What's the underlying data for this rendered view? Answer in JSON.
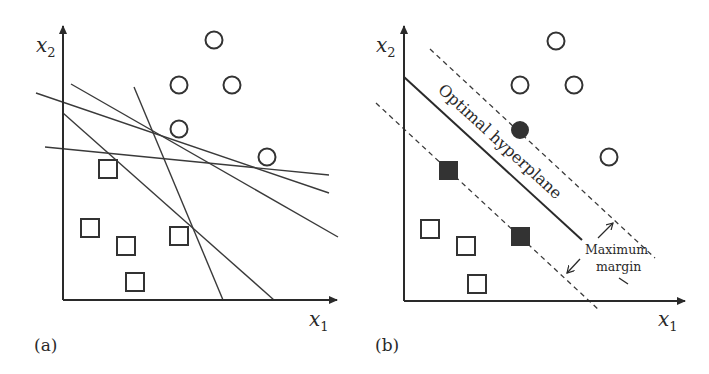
{
  "figure": {
    "panels": [
      {
        "id": "a",
        "label": "(a)",
        "x_axis_label": "x",
        "x_axis_sub": "1",
        "y_axis_label": "x",
        "y_axis_sub": "2",
        "description": "Many possible separating lines",
        "circles": [
          [
            214,
            40
          ],
          [
            179,
            85
          ],
          [
            232,
            85
          ],
          [
            179,
            129
          ],
          [
            267,
            157
          ]
        ],
        "squares": [
          [
            108,
            169
          ],
          [
            90,
            228
          ],
          [
            126,
            246
          ],
          [
            179,
            236
          ],
          [
            135,
            282
          ]
        ],
        "lines": [
          [
            36,
            93,
            329,
            193
          ],
          [
            71,
            84,
            338,
            237
          ],
          [
            63,
            113,
            274,
            300
          ],
          [
            45,
            147,
            329,
            175
          ],
          [
            134,
            87,
            223,
            300
          ]
        ]
      },
      {
        "id": "b",
        "label": "(b)",
        "x_axis_label": "x",
        "x_axis_sub": "1",
        "y_axis_label": "x",
        "y_axis_sub": "2",
        "hyperplane_label": "Optimal hyperplane",
        "margin_label_line1": "Maximum",
        "margin_label_line2": "margin",
        "open_circles": [
          [
            556,
            41
          ],
          [
            520,
            85
          ],
          [
            574,
            85
          ],
          [
            609,
            157
          ]
        ],
        "support_circles": [
          [
            520,
            130
          ]
        ],
        "open_squares": [
          [
            430,
            229
          ],
          [
            466,
            246
          ],
          [
            477,
            284
          ]
        ],
        "support_squares": [
          [
            448,
            170
          ],
          [
            520,
            236
          ]
        ]
      }
    ],
    "colors": {
      "ink": "#2a2a2a",
      "fill": "#333333",
      "background": "#ffffff"
    }
  }
}
